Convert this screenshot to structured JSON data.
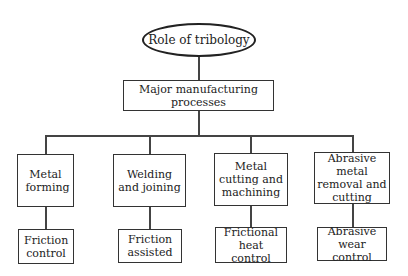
{
  "diagram": {
    "root": {
      "label": "Role of tribology"
    },
    "level1": {
      "label": "Major manufacturing processes"
    },
    "processes": [
      {
        "label": "Metal forming",
        "role": "Friction control"
      },
      {
        "label": "Welding and joining",
        "role": "Friction assisted"
      },
      {
        "label": "Metal cutting and machining",
        "role": "Frictional heat control"
      },
      {
        "label": "Abrasive metal removal and cutting",
        "role": "Abrasive wear control"
      }
    ]
  }
}
